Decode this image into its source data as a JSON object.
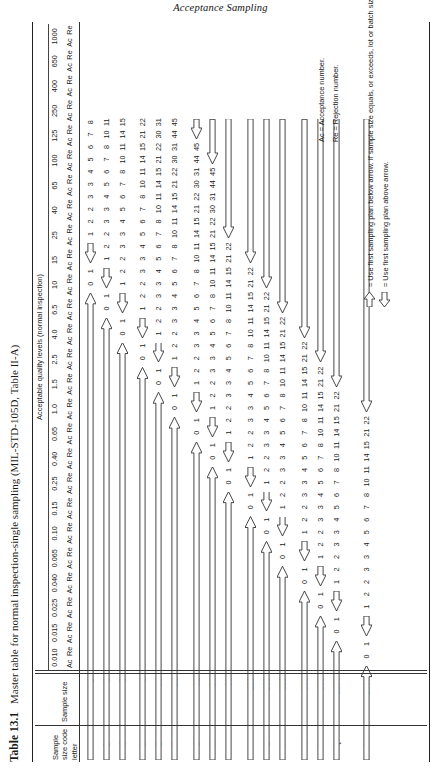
{
  "running_head": "Acceptance Sampling",
  "caption": {
    "label": "Table 13.1",
    "text": "Master table for normal inspection-single sampling (MIL-STD-105D, Table II-A)"
  },
  "header": {
    "aql_banner": "Acceptable quality levels (normal inspection)",
    "stub_sample_size_code_letter": "Sample size code letter",
    "stub_sample_size": "Sample size",
    "ac_label": "Ac",
    "re_label": "Re"
  },
  "aql_columns": [
    "0.010",
    "0.015",
    "0.025",
    "0.040",
    "0.065",
    "0.10",
    "0.15",
    "0.25",
    "0.40",
    "0.65",
    "1.0",
    "1.5",
    "2.5",
    "4.0",
    "6.5",
    "10",
    "15",
    "25",
    "40",
    "65",
    "100",
    "125",
    "250",
    "400",
    "650",
    "1000"
  ],
  "rows": [
    {
      "letter": "A",
      "sample_size": "2"
    },
    {
      "letter": "B",
      "sample_size": "3"
    },
    {
      "letter": "C",
      "sample_size": "5"
    },
    {
      "letter": "D",
      "sample_size": "8"
    },
    {
      "letter": "E",
      "sample_size": "13"
    },
    {
      "letter": "F",
      "sample_size": "20"
    },
    {
      "letter": "G",
      "sample_size": "32"
    },
    {
      "letter": "H",
      "sample_size": "50"
    },
    {
      "letter": "I",
      "sample_size": "80"
    },
    {
      "letter": "K",
      "sample_size": "125"
    },
    {
      "letter": "L",
      "sample_size": "200"
    },
    {
      "letter": "M",
      "sample_size": "315"
    },
    {
      "letter": "N",
      "sample_size": "500"
    },
    {
      "letter": "P",
      "sample_size": "800"
    },
    {
      "letter": "Q",
      "sample_size": "1250"
    },
    {
      "letter": "R",
      "sample_size": "2000"
    }
  ],
  "notes": [
    {
      "glyph": "down-arrow-icon",
      "text": "= Use first sampling plan below arrow. If sample size equals, or exceeds, lot or batch size, do 100 percent inspection."
    },
    {
      "glyph": "up-arrow-icon",
      "text": "= Use first sampling plan above arrow."
    }
  ],
  "definitions": [
    "Ac = Acceptance number.",
    "Re = Rejection number."
  ],
  "chart_data": {
    "type": "table",
    "title": "Master table for normal inspection-single sampling (MIL-STD-105D, Table II-A)",
    "col_header_group": "Acceptable quality levels (normal inspection)",
    "row_key": [
      "letter",
      "sample_size"
    ],
    "columns": [
      "0.010",
      "0.015",
      "0.025",
      "0.040",
      "0.065",
      "0.10",
      "0.15",
      "0.25",
      "0.40",
      "0.65",
      "1.0",
      "1.5",
      "2.5",
      "4.0",
      "6.5",
      "10",
      "15",
      "25",
      "40",
      "65",
      "100",
      "125",
      "250",
      "400",
      "650",
      "1000"
    ],
    "subcolumns": [
      "Ac",
      "Re"
    ],
    "legend": "down arrow = use first sampling plan below arrow; up arrow = use first sampling plan above arrow",
    "cells": {
      "A": [
        "d",
        "d",
        "d",
        "d",
        "d",
        "d",
        "d",
        "d",
        "d",
        "d",
        "d",
        "d",
        "d",
        "d",
        "d",
        "d",
        "d",
        "d",
        "d",
        "0 1",
        "u",
        "1 2",
        "2 3",
        "3 4",
        "5 6",
        "7 8"
      ],
      "B": [
        "d",
        "d",
        "d",
        "d",
        "d",
        "d",
        "d",
        "d",
        "d",
        "d",
        "d",
        "d",
        "d",
        "d",
        "d",
        "d",
        "d",
        "d",
        "0 1",
        "u",
        "1 2",
        "2 3",
        "3 4",
        "5 6",
        "7 8",
        "10 11"
      ],
      "C": [
        "d",
        "d",
        "d",
        "d",
        "d",
        "d",
        "d",
        "d",
        "d",
        "d",
        "d",
        "d",
        "d",
        "d",
        "d",
        "d",
        "d",
        "0 1",
        "u",
        "1 2",
        "2 3",
        "3 4",
        "5 6",
        "7 8",
        "10 11",
        "14 15"
      ],
      "D": [
        "d",
        "d",
        "d",
        "d",
        "d",
        "d",
        "d",
        "d",
        "d",
        "d",
        "d",
        "d",
        "d",
        "d",
        "d",
        "d",
        "0 1",
        "u",
        "1 2",
        "2 3",
        "3 4",
        "5 6",
        "7 8",
        "10 11",
        "14 15",
        "21 22"
      ],
      "E": [
        "d",
        "d",
        "d",
        "d",
        "d",
        "d",
        "d",
        "d",
        "d",
        "d",
        "d",
        "d",
        "d",
        "d",
        "d",
        "0 1",
        "u",
        "1 2",
        "2 3",
        "3 4",
        "5 6",
        "7 8",
        "10 11",
        "14 15",
        "21 22",
        "30 31"
      ],
      "F": [
        "d",
        "d",
        "d",
        "d",
        "d",
        "d",
        "d",
        "d",
        "d",
        "d",
        "d",
        "d",
        "d",
        "d",
        "0 1",
        "u",
        "1 2",
        "2 3",
        "3 4",
        "5 6",
        "7 8",
        "10 11",
        "14 15",
        "21 22",
        "30 31",
        "44 45"
      ],
      "G": [
        "d",
        "d",
        "d",
        "d",
        "d",
        "d",
        "d",
        "d",
        "d",
        "d",
        "d",
        "d",
        "d",
        "0 1",
        "u",
        "1 2",
        "2 3",
        "3 4",
        "5 6",
        "7 8",
        "10 11",
        "14 15",
        "21 22",
        "30 31",
        "44 45",
        "u"
      ],
      "H": [
        "d",
        "d",
        "d",
        "d",
        "d",
        "d",
        "d",
        "d",
        "d",
        "d",
        "d",
        "d",
        "0 1",
        "u",
        "1 2",
        "2 3",
        "3 4",
        "5 6",
        "7 8",
        "10 11",
        "14 15",
        "21 22",
        "30 31",
        "44 45",
        "u",
        "u"
      ],
      "I": [
        "d",
        "d",
        "d",
        "d",
        "d",
        "d",
        "d",
        "d",
        "d",
        "d",
        "d",
        "0 1",
        "u",
        "1 2",
        "2 3",
        "3 4",
        "5 6",
        "7 8",
        "10 11",
        "14 15",
        "21 22",
        "u",
        "u",
        "u",
        "u",
        "u"
      ],
      "K": [
        "d",
        "d",
        "d",
        "d",
        "d",
        "d",
        "d",
        "d",
        "d",
        "d",
        "0 1",
        "u",
        "1 2",
        "2 3",
        "3 4",
        "5 6",
        "7 8",
        "10 11",
        "14 15",
        "21 22",
        "u",
        "u",
        "u",
        "u",
        "u",
        "u"
      ],
      "L": [
        "d",
        "d",
        "d",
        "d",
        "d",
        "d",
        "d",
        "d",
        "d",
        "0 1",
        "u",
        "1 2",
        "2 3",
        "3 4",
        "5 6",
        "7 8",
        "10 11",
        "14 15",
        "21 22",
        "u",
        "u",
        "u",
        "u",
        "u",
        "u",
        "u"
      ],
      "M": [
        "d",
        "d",
        "d",
        "d",
        "d",
        "d",
        "d",
        "d",
        "0 1",
        "u",
        "1 2",
        "2 3",
        "3 4",
        "5 6",
        "7 8",
        "10 11",
        "14 15",
        "21 22",
        "u",
        "u",
        "u",
        "u",
        "u",
        "u",
        "u",
        "u"
      ],
      "N": [
        "d",
        "d",
        "d",
        "d",
        "d",
        "d",
        "d",
        "0 1",
        "u",
        "1 2",
        "2 3",
        "3 4",
        "5 6",
        "7 8",
        "10 11",
        "14 15",
        "21 22",
        "u",
        "u",
        "u",
        "u",
        "u",
        "u",
        "u",
        "u",
        "u"
      ],
      "P": [
        "d",
        "d",
        "d",
        "d",
        "d",
        "d",
        "0 1",
        "u",
        "1 2",
        "2 3",
        "3 4",
        "5 6",
        "7 8",
        "10 11",
        "14 15",
        "21 22",
        "u",
        "u",
        "u",
        "u",
        "u",
        "u",
        "u",
        "u",
        "u",
        "u"
      ],
      "Q": [
        "d",
        "d",
        "d",
        "d",
        "d",
        "0 1",
        "u",
        "1 2",
        "2 3",
        "3 4",
        "5 6",
        "7 8",
        "10 11",
        "14 15",
        "21 22",
        "u",
        "u",
        "u",
        "u",
        "u",
        "u",
        "u",
        "u",
        "u",
        "u",
        "u"
      ],
      "R": [
        "d",
        "d",
        "d",
        "d",
        "0 1",
        "u",
        "1 2",
        "2 3",
        "3 4",
        "5 6",
        "7 8",
        "10 11",
        "14 15",
        "21 22",
        "u",
        "u",
        "u",
        "u",
        "u",
        "u",
        "u",
        "u",
        "u",
        "u",
        "u",
        "u"
      ]
    }
  }
}
